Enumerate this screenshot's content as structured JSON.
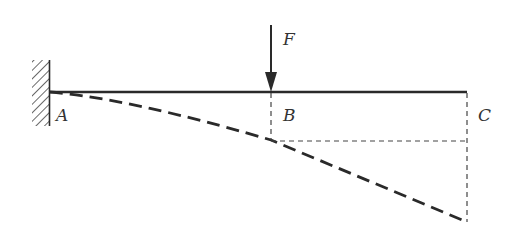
{
  "diagram": {
    "type": "cantilever-beam-deflection",
    "colors": {
      "line": "#2a2a2a",
      "label": "#333333",
      "background": "#ffffff"
    },
    "labels": {
      "force": "F",
      "point_a": "A",
      "point_b": "B",
      "point_c": "C"
    },
    "elements": {
      "support": "fixed-wall-hatched",
      "beam": "solid-horizontal-line",
      "force_arrow": "downward-arrow-at-B",
      "deflection_curve": "dashed-curve-A-to-C",
      "projection_lines": "thin-dashed-lines"
    }
  }
}
